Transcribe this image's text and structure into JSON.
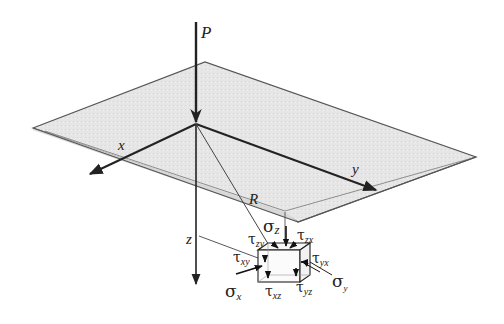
{
  "diagram": {
    "type": "3d-stress-element",
    "labels": {
      "load": "P",
      "axis_x": "x",
      "axis_y": "y",
      "axis_z": "z",
      "distance": "R"
    },
    "stresses": {
      "sigma_z": {
        "sym": "σ",
        "sub": "z"
      },
      "sigma_x": {
        "sym": "σ",
        "sub": "x"
      },
      "sigma_y": {
        "sym": "σ",
        "sub": "y"
      },
      "tau_zy": {
        "sym": "τ",
        "sub": "zy"
      },
      "tau_zx": {
        "sym": "τ",
        "sub": "zx"
      },
      "tau_xy": {
        "sym": "τ",
        "sub": "xy"
      },
      "tau_yx": {
        "sym": "τ",
        "sub": "yx"
      },
      "tau_xz": {
        "sym": "τ",
        "sub": "xz"
      },
      "tau_yz": {
        "sym": "τ",
        "sub": "yz"
      }
    },
    "colors": {
      "plane_fill": "#e4e4e4",
      "plane_edge": "#555555",
      "line": "#222222",
      "thin_line": "#444444"
    }
  }
}
